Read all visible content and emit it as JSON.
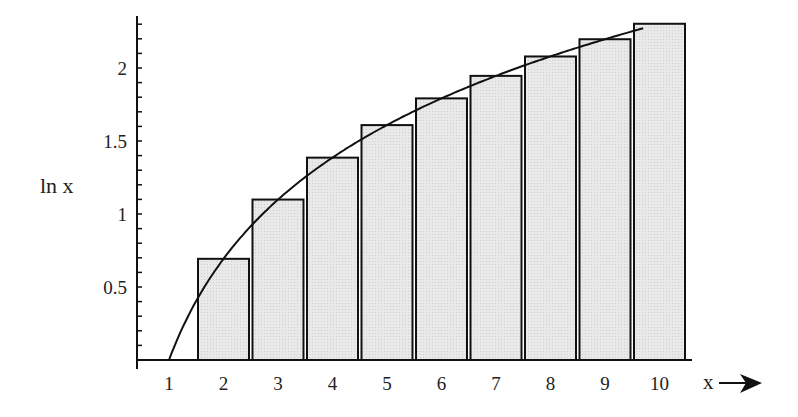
{
  "chart_data": {
    "type": "bar",
    "title": "",
    "xlabel": "x",
    "ylabel": "ln x",
    "categories": [
      "2",
      "3",
      "4",
      "5",
      "6",
      "7",
      "8",
      "9",
      "10"
    ],
    "values": [
      0.693,
      1.099,
      1.386,
      1.609,
      1.792,
      1.946,
      2.079,
      2.197,
      2.303
    ],
    "series": [
      {
        "name": "rectangles (ln n)",
        "type": "bar",
        "x": [
          2,
          3,
          4,
          5,
          6,
          7,
          8,
          9,
          10
        ],
        "values": [
          0.693,
          1.099,
          1.386,
          1.609,
          1.792,
          1.946,
          2.079,
          2.197,
          2.303
        ]
      },
      {
        "name": "ln x curve",
        "type": "line",
        "function": "ln(x)",
        "domain": [
          1,
          10
        ]
      }
    ],
    "x_ticks": [
      "1",
      "2",
      "3",
      "4",
      "5",
      "6",
      "7",
      "8",
      "9",
      "10"
    ],
    "y_ticks": [
      "0.5",
      "1",
      "1.5",
      "2"
    ],
    "xlim": [
      0.4,
      10.5
    ],
    "ylim": [
      0,
      2.35
    ],
    "grid": false,
    "legend": "none",
    "colors": {
      "bar_fill": "#e6e6e6",
      "bar_stroke": "#111111",
      "curve": "#111111",
      "axis": "#111111"
    }
  },
  "axes": {
    "y_label": "ln x",
    "x_label": "x",
    "x_arrow": "right-arrow"
  }
}
